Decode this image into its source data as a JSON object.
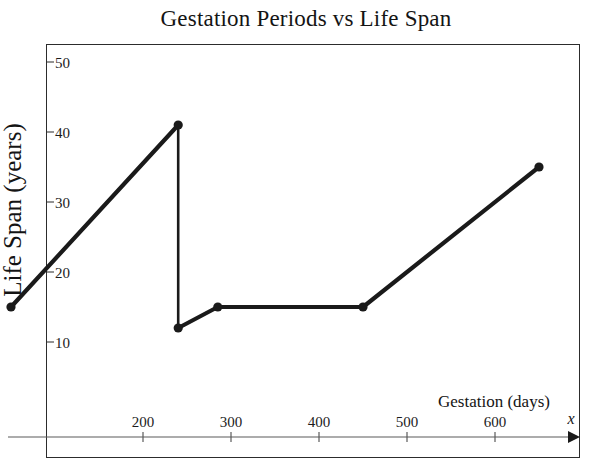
{
  "chart_data": {
    "type": "line",
    "title": "Gestation Periods vs Life Span",
    "xlabel": "Gestation (days)",
    "ylabel": "Life Span (years)",
    "x_axis_variable": "x",
    "xlim": [
      0,
      700
    ],
    "ylim": [
      0,
      55
    ],
    "xticks": [
      200,
      300,
      400,
      500,
      600
    ],
    "yticks": [
      10,
      20,
      30,
      40,
      50
    ],
    "xtick_labels": [
      "200",
      "300",
      "400",
      "500",
      "600"
    ],
    "ytick_labels": [
      "10",
      "20",
      "30",
      "40",
      "50"
    ],
    "grid": false,
    "legend": "none",
    "markers": true,
    "x": [
      50,
      240,
      240,
      285,
      450,
      650
    ],
    "y": [
      15,
      41,
      12,
      15,
      15,
      35
    ],
    "points": [
      {
        "x": 50,
        "y": 15,
        "label": "15"
      },
      {
        "x": 240,
        "y": 41,
        "label": "41"
      },
      {
        "x": 240,
        "y": 12,
        "label": "12"
      },
      {
        "x": 285,
        "y": 15,
        "label": "15"
      },
      {
        "x": 450,
        "y": 15,
        "label": "15"
      },
      {
        "x": 650,
        "y": 35,
        "label": "35"
      }
    ],
    "series": [
      {
        "name": "Life Span",
        "values": [
          15,
          41,
          12,
          15,
          15,
          35
        ]
      }
    ]
  },
  "ticks": {
    "x": [
      {
        "value": 200,
        "label": "200"
      },
      {
        "value": 300,
        "label": "300"
      },
      {
        "value": 400,
        "label": "400"
      },
      {
        "value": 500,
        "label": "500"
      },
      {
        "value": 600,
        "label": "600"
      }
    ],
    "y": [
      {
        "value": 10,
        "label": "10"
      },
      {
        "value": 20,
        "label": "20"
      },
      {
        "value": 30,
        "label": "30"
      },
      {
        "value": 40,
        "label": "40"
      },
      {
        "value": 50,
        "label": "50"
      }
    ]
  },
  "labels": {
    "title": "Gestation Periods vs Life Span",
    "y_axis": "Life Span (years)",
    "x_axis": "Gestation (days)",
    "x_variable": "x"
  },
  "colors": {
    "line": "#1a1a1a",
    "marker": "#1a1a1a",
    "frame": "#2c2c2c",
    "axis": "#5a5a5a",
    "text": "#141414",
    "background": "#ffffff"
  }
}
